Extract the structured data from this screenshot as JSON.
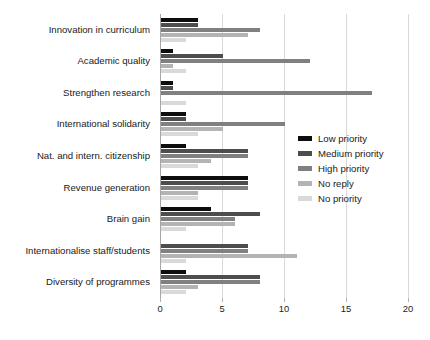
{
  "chart_data": {
    "type": "bar",
    "orientation": "horizontal",
    "title": "",
    "xlabel": "",
    "ylabel": "",
    "xlim": [
      0,
      20
    ],
    "xticks": [
      0,
      5,
      10,
      15,
      20
    ],
    "xtick_labels": [
      "0",
      "5",
      "10",
      "15",
      "20"
    ],
    "grid": "vertical",
    "legend_position": "center-right",
    "categories": [
      "Innovation in curriculum",
      "Academic quality",
      "Strengthen research",
      "International solidarity",
      "Nat. and intern. citizenship",
      "Revenue generation",
      "Brain gain",
      "Internationalise staff/students",
      "Diversity of programmes"
    ],
    "series": [
      {
        "name": "Low priority",
        "color": "#0d0d0d",
        "values": [
          3,
          1,
          1,
          2,
          2,
          7,
          4,
          0,
          2
        ]
      },
      {
        "name": "Medium priority",
        "color": "#4d4d4d",
        "values": [
          3,
          5,
          1,
          2,
          7,
          7,
          8,
          7,
          8
        ]
      },
      {
        "name": "High priority",
        "color": "#808080",
        "values": [
          8,
          12,
          17,
          10,
          7,
          7,
          6,
          7,
          8
        ]
      },
      {
        "name": "No reply",
        "color": "#b3b3b3",
        "values": [
          7,
          1,
          0,
          5,
          4,
          3,
          6,
          11,
          3
        ]
      },
      {
        "name": "No priority",
        "color": "#d9d9d9",
        "values": [
          2,
          2,
          2,
          3,
          3,
          3,
          2,
          2,
          2
        ]
      }
    ]
  },
  "colors": {
    "background": "#ffffff",
    "gridline": "#d9d9d9",
    "axis": "#a6a6a6",
    "text": "#1a1a1a"
  }
}
